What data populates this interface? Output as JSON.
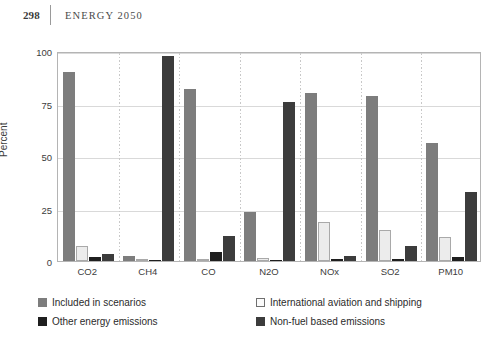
{
  "header": {
    "folio": "298",
    "running_title": "ENERGY 2050"
  },
  "chart_data": {
    "type": "bar",
    "title": "",
    "xlabel": "",
    "ylabel": "Percent",
    "ylim": [
      0,
      100
    ],
    "yticks": [
      "0",
      "25",
      "50",
      "75",
      "100"
    ],
    "grid": "horizontal gridlines at 25/50/75/100, dotted vertical separators between categories",
    "legend_position": "below plot, two columns",
    "categories": [
      "CO2",
      "CH4",
      "CO",
      "N2O",
      "NOx",
      "SO2",
      "PM10"
    ],
    "series": [
      {
        "name": "Included in scenarios",
        "color": "#7d7d7d",
        "values": [
          90,
          2.5,
          82,
          23.5,
          80,
          78.5,
          56
        ]
      },
      {
        "name": "International aviation and shipping",
        "color": "#ececec",
        "values": [
          7,
          0.4,
          1,
          1.5,
          18.5,
          15,
          11.5
        ]
      },
      {
        "name": "Other energy emissions",
        "color": "#1f1f1f",
        "values": [
          2,
          0.5,
          4.5,
          0.5,
          1,
          1,
          2
        ]
      },
      {
        "name": "Non-fuel based emissions",
        "color": "#3c3c3c",
        "values": [
          3.5,
          97.5,
          12,
          75.5,
          2.5,
          7,
          33
        ]
      }
    ]
  }
}
